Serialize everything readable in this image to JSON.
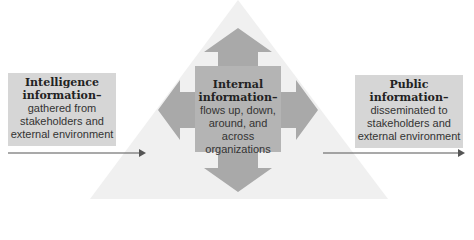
{
  "colors": {
    "pyramid": "#f0f0f0",
    "arrow_cross": "#a9a9a9",
    "center_square": "#b4b4b4",
    "side_box": "#d6d6d6",
    "flow_arrow": "#555555"
  },
  "left_box": {
    "title_line1": "Intelligence",
    "title_line2": "information–",
    "body_line1": "gathered from",
    "body_line2": "stakeholders and",
    "body_line3": "external environment"
  },
  "center_box": {
    "title_line1": "Internal",
    "title_line2": "information–",
    "body_line1": "flows up, down,",
    "body_line2": "around, and",
    "body_line3": "across",
    "body_line4": "organizations"
  },
  "right_box": {
    "title_line1": "Public",
    "title_line2": "information–",
    "body_line1": "disseminated to",
    "body_line2": "stakeholders and",
    "body_line3": "external environment"
  }
}
